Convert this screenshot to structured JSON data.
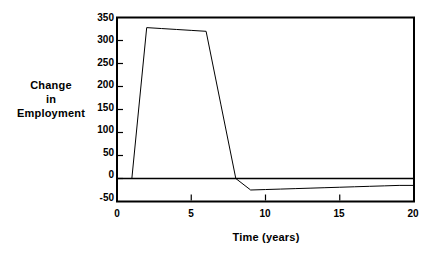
{
  "chart_data": {
    "type": "line",
    "title": "",
    "xlabel": "Time (years)",
    "ylabel": "Change in Employment",
    "ylabel_lines": [
      "Change",
      "in",
      "Employment"
    ],
    "xlim": [
      0,
      20
    ],
    "ylim": [
      -50,
      350
    ],
    "xticks": [
      0,
      5,
      10,
      15,
      20
    ],
    "xtick_labels": [
      "0",
      "5",
      "10",
      "15",
      "20"
    ],
    "yticks": [
      -50,
      0,
      50,
      100,
      150,
      200,
      250,
      300,
      350
    ],
    "ytick_labels": [
      "-50",
      "0",
      "50",
      "100",
      "150",
      "200",
      "250",
      "300",
      "350"
    ],
    "grid": false,
    "legend": "none",
    "zero_line": true,
    "line_color": "#000000",
    "frame_color": "#000000",
    "background": "#ffffff",
    "series": [
      {
        "name": "Change in Employment",
        "x": [
          0,
          1,
          2,
          3,
          4,
          5,
          6,
          7,
          8,
          9,
          10,
          11,
          12,
          13,
          14,
          15,
          16,
          17,
          18,
          19,
          20
        ],
        "values": [
          0,
          0,
          328,
          326,
          324,
          322,
          320,
          160,
          0,
          -25,
          -24,
          -23,
          -22,
          -21,
          -20,
          -19,
          -18,
          -17,
          -16,
          -15,
          -15
        ]
      }
    ]
  }
}
